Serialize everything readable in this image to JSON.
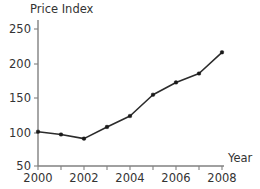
{
  "chart_data": {
    "type": "line",
    "title": "",
    "ylabel": "Price Index",
    "xlabel": "Year",
    "x": [
      2000,
      2001,
      2002,
      2003,
      2004,
      2005,
      2006,
      2007,
      2008
    ],
    "values": [
      100,
      96,
      90,
      107,
      123,
      154,
      172,
      185,
      216
    ],
    "series": [
      {
        "name": "Price Index",
        "values": [
          100,
          96,
          90,
          107,
          123,
          154,
          172,
          185,
          216
        ]
      }
    ],
    "xlim": [
      2000,
      2008
    ],
    "ylim": [
      50,
      250
    ],
    "y_ticks": [
      50,
      100,
      150,
      200,
      250
    ],
    "y_tick_labels": [
      "50",
      "100",
      "150",
      "200",
      "250"
    ],
    "x_ticks": [
      2000,
      2001,
      2002,
      2003,
      2004,
      2005,
      2006,
      2007,
      2008
    ],
    "x_tick_labels": [
      "2000",
      "",
      "2002",
      "",
      "2004",
      "",
      "2006",
      "",
      "2008"
    ],
    "x_labels_shown": [
      "2000",
      "2002",
      "2004",
      "2006",
      "2008"
    ],
    "grid": false,
    "legend": false,
    "legend_position": "none",
    "marker": "square",
    "colors": {
      "line": "#2b2b2b",
      "marker": "#1a1a1a",
      "axis": "#808080",
      "text": "#333333",
      "background": "#ffffff"
    }
  },
  "labels": {
    "y_axis_title": "Price Index",
    "x_axis_title": "Year",
    "y_tick_250": "250",
    "y_tick_200": "200",
    "y_tick_150": "150",
    "y_tick_100": "100",
    "y_tick_50": "50",
    "x_tick_2000": "2000",
    "x_tick_2002": "2002",
    "x_tick_2004": "2004",
    "x_tick_2006": "2006",
    "x_tick_2008": "2008"
  }
}
